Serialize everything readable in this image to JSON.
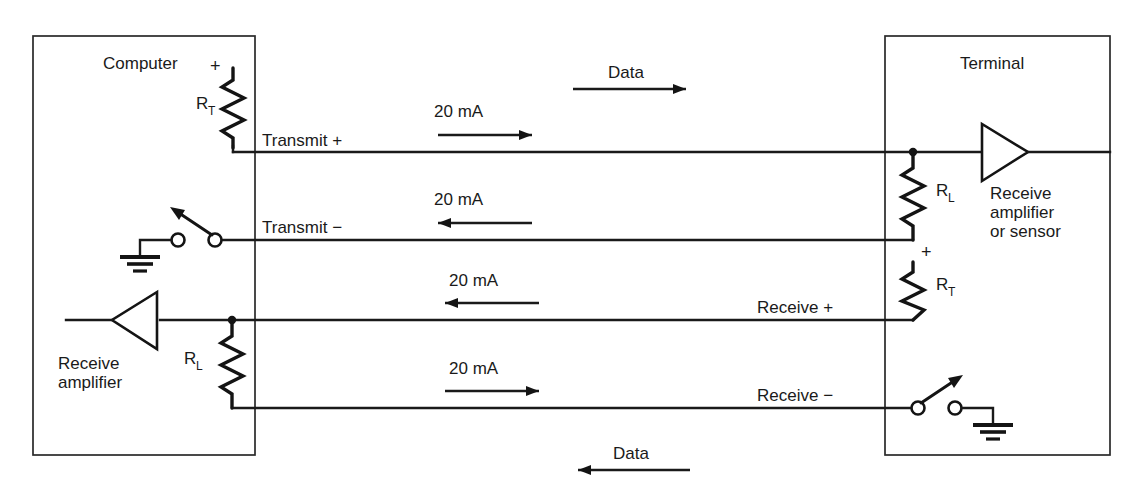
{
  "diagram": {
    "title_hidden": "20 mA current-loop interface between computer and terminal",
    "boxes": [
      {
        "name": "computer",
        "label": "Computer"
      },
      {
        "name": "terminal",
        "label": "Terminal"
      }
    ],
    "flow_labels": [
      {
        "name": "data-top",
        "label": "Data",
        "direction": "right"
      },
      {
        "name": "data-bottom",
        "label": "Data",
        "direction": "left"
      }
    ],
    "signal_lines": [
      {
        "name": "transmit-plus",
        "label": "Transmit +",
        "current": "20 mA",
        "direction": "right"
      },
      {
        "name": "transmit-minus",
        "label": "Transmit −",
        "current": "20 mA",
        "direction": "left"
      },
      {
        "name": "receive-plus",
        "label": "Receive +",
        "current": "20 mA",
        "direction": "left"
      },
      {
        "name": "receive-minus",
        "label": "Receive −",
        "current": "20 mA",
        "direction": "right"
      }
    ],
    "components": {
      "computer_rt": {
        "symbol": "R",
        "subscript": "T",
        "polarity": "+"
      },
      "computer_rl": {
        "symbol": "R",
        "subscript": "L"
      },
      "terminal_rl": {
        "symbol": "R",
        "subscript": "L"
      },
      "terminal_rt": {
        "symbol": "R",
        "subscript": "T",
        "polarity": "+"
      }
    },
    "amplifiers": [
      {
        "name": "computer-receive-amplifier",
        "lines": [
          "Receive",
          "amplifier"
        ]
      },
      {
        "name": "terminal-receive-amplifier",
        "lines": [
          "Receive",
          "amplifier",
          "or sensor"
        ]
      }
    ],
    "colors": {
      "ink": "#1a1a1a",
      "background": "#ffffff",
      "box_stroke": "#2a2a2a"
    }
  }
}
